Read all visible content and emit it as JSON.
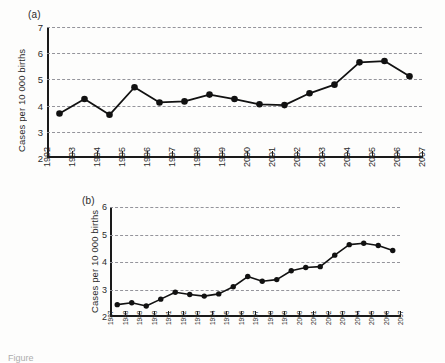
{
  "figure": {
    "caption_fragment": "Figure",
    "panel_a_tag": "(a)",
    "panel_b_tag": "(b)"
  },
  "chart_data": [
    {
      "id": "panel-a",
      "type": "line",
      "title": "(a)",
      "xlabel": "",
      "ylabel": "Cases per 10 000 births",
      "ylim": [
        2,
        7
      ],
      "yticks": [
        2,
        3,
        4,
        5,
        6,
        7
      ],
      "xlim": [
        1992,
        2007
      ],
      "xticks": [
        1992,
        1993,
        1994,
        1995,
        1996,
        1997,
        1998,
        1999,
        2000,
        2001,
        2002,
        2003,
        2004,
        2005,
        2006,
        2007
      ],
      "grid": true,
      "grid_style": "dashed-horizontal",
      "legend": "none",
      "x": [
        1992.5,
        1993.5,
        1994.5,
        1995.5,
        1996.5,
        1997.5,
        1998.5,
        1999.5,
        2000.5,
        2001.5,
        2002.5,
        2003.5,
        2004.5,
        2005.5,
        2006.5
      ],
      "categories": [
        "1992",
        "1993",
        "1994",
        "1995",
        "1996",
        "1997",
        "1998",
        "1999",
        "2000",
        "2001",
        "2002",
        "2003",
        "2004",
        "2005",
        "2006"
      ],
      "values": [
        3.7,
        4.25,
        3.65,
        4.7,
        4.12,
        4.16,
        4.42,
        4.25,
        4.05,
        4.02,
        4.47,
        4.8,
        5.65,
        5.7,
        5.12
      ],
      "marker": "filled-circle",
      "color": "#111111"
    },
    {
      "id": "panel-b",
      "type": "line",
      "title": "(b)",
      "xlabel": "",
      "ylabel": "Cases per 10 000 births",
      "ylim": [
        2,
        6
      ],
      "yticks": [
        2,
        3,
        4,
        5,
        6
      ],
      "xlim": [
        1987,
        2007
      ],
      "xticks": [
        1987,
        1988,
        1989,
        1990,
        1991,
        1992,
        1993,
        1994,
        1995,
        1996,
        1997,
        1998,
        1999,
        2000,
        2001,
        2002,
        2003,
        2004,
        2005,
        2006,
        2007
      ],
      "grid": true,
      "grid_style": "dashed-horizontal",
      "legend": "none",
      "x": [
        1987.5,
        1988.5,
        1989.5,
        1990.5,
        1991.5,
        1992.5,
        1993.5,
        1994.5,
        1995.5,
        1996.5,
        1997.5,
        1998.5,
        1999.5,
        2000.5,
        2001.5,
        2002.5,
        2003.5,
        2004.5,
        2005.5,
        2006.5
      ],
      "categories": [
        "1987",
        "1988",
        "1989",
        "1990",
        "1991",
        "1992",
        "1993",
        "1994",
        "1995",
        "1996",
        "1997",
        "1998",
        "1999",
        "2000",
        "2001",
        "2002",
        "2003",
        "2004",
        "2005",
        "2006"
      ],
      "values": [
        2.45,
        2.52,
        2.4,
        2.65,
        2.9,
        2.82,
        2.76,
        2.84,
        3.1,
        3.47,
        3.3,
        3.36,
        3.68,
        3.8,
        3.83,
        4.25,
        4.63,
        4.68,
        4.6,
        4.42
      ],
      "marker": "filled-circle",
      "color": "#111111"
    }
  ]
}
